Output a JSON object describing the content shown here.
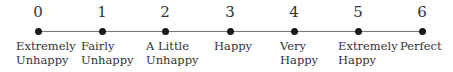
{
  "scale": {
    "line_color": "#777777",
    "dot_color": "#1a1a1a",
    "points": [
      {
        "value": "0",
        "label_line1": "Extremely",
        "label_line2": "Unhappy"
      },
      {
        "value": "1",
        "label_line1": "Fairly",
        "label_line2": "Unhappy"
      },
      {
        "value": "2",
        "label_line1": "A Little",
        "label_line2": "Unhappy"
      },
      {
        "value": "3",
        "label_line1": "Happy",
        "label_line2": ""
      },
      {
        "value": "4",
        "label_line1": "Very",
        "label_line2": "Happy"
      },
      {
        "value": "5",
        "label_line1": "Extremely",
        "label_line2": "Happy"
      },
      {
        "value": "6",
        "label_line1": "Perfect",
        "label_line2": ""
      }
    ]
  }
}
